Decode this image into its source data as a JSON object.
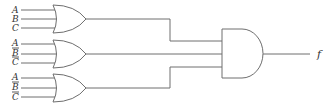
{
  "diagram": {
    "type": "logic-circuit",
    "colors": {
      "line": "#6e6e6e",
      "text": "#333333",
      "background": "#ffffff"
    },
    "or_gates": [
      {
        "id": "or1",
        "inputs": [
          {
            "label": "A",
            "negated": false
          },
          {
            "label": "B",
            "negated": false
          },
          {
            "label": "C",
            "negated": false
          }
        ]
      },
      {
        "id": "or2",
        "inputs": [
          {
            "label": "A",
            "negated": false
          },
          {
            "label": "B",
            "negated": true
          },
          {
            "label": "C",
            "negated": true
          }
        ]
      },
      {
        "id": "or3",
        "inputs": [
          {
            "label": "A",
            "negated": false
          },
          {
            "label": "B",
            "negated": true
          },
          {
            "label": "C",
            "negated": true
          }
        ]
      }
    ],
    "and_gate": {
      "id": "and1",
      "inputs": [
        "or1",
        "or2",
        "or3"
      ]
    },
    "output": {
      "label": "f"
    }
  }
}
